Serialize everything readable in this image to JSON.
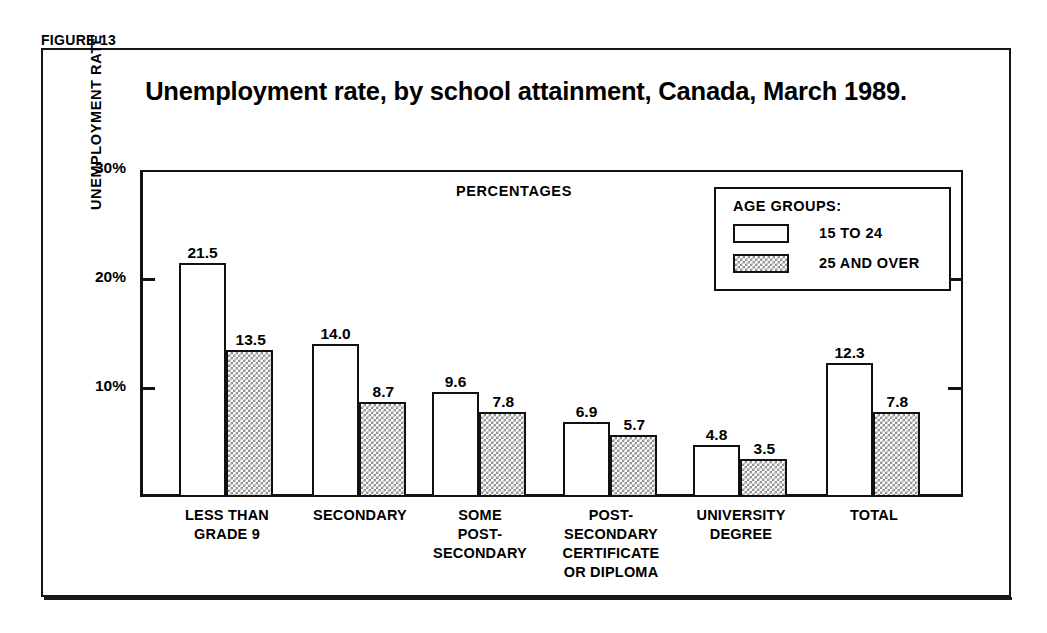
{
  "figure": {
    "label": "FIGURE 13"
  },
  "chart_data": {
    "type": "bar",
    "title": "Unemployment rate, by school attainment, Canada, March 1989.",
    "xlabel": "",
    "ylabel": "UNEMPLOYMENT RATE",
    "annotation": "PERCENTAGES",
    "ylim": [
      0,
      30
    ],
    "ytick_labels": [
      "10%",
      "20%",
      "30%"
    ],
    "ytick_values": [
      10,
      20,
      30
    ],
    "grid": false,
    "legend_position": "top-right",
    "legend_title": "AGE GROUPS:",
    "categories": [
      "LESS THAN\nGRADE 9",
      "SECONDARY",
      "SOME\nPOST-\nSECONDARY",
      "POST-\nSECONDARY\nCERTIFICATE\nOR DIPLOMA",
      "UNIVERSITY\nDEGREE",
      "TOTAL"
    ],
    "series": [
      {
        "name": "15 TO 24",
        "fill": "open",
        "values": [
          21.5,
          14.0,
          9.6,
          6.9,
          4.8,
          12.3
        ],
        "labels": [
          "21.5",
          "14.0",
          "9.6",
          "6.9",
          "4.8",
          "12.3"
        ]
      },
      {
        "name": "25 AND OVER",
        "fill": "hatched",
        "values": [
          13.5,
          8.7,
          7.8,
          5.7,
          3.5,
          7.8
        ],
        "labels": [
          "13.5",
          "8.7",
          "7.8",
          "5.7",
          "3.5",
          "7.8"
        ]
      }
    ],
    "colors": {
      "ink": "#111111",
      "background": "#ffffff",
      "hatch": "#8e8e8e"
    }
  }
}
